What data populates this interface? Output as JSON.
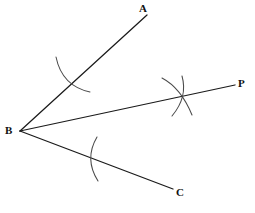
{
  "figure": {
    "background_color": "#ffffff",
    "line_color": "#1a1a1a",
    "arc_color": "#4a4a4a",
    "label_color": "#111111"
  },
  "labels": {
    "a": "A",
    "b": "B",
    "c": "C",
    "p": "P"
  },
  "chart_data": {
    "type": "diagram",
    "vertex": {
      "name": "B",
      "x": 20,
      "y": 131
    },
    "rays": [
      {
        "name": "BA",
        "from": [
          20,
          131
        ],
        "to": [
          147,
          15
        ],
        "endpoint_label": "A"
      },
      {
        "name": "BP",
        "from": [
          20,
          131
        ],
        "to": [
          235,
          85
        ],
        "endpoint_label": "P"
      },
      {
        "name": "BC",
        "from": [
          20,
          131
        ],
        "to": [
          173,
          189
        ],
        "endpoint_label": "C"
      }
    ],
    "arcs": [
      {
        "name": "arc-on-BA",
        "start": [
          56,
          57
        ],
        "end": [
          90,
          92
        ],
        "crosses_ray": "BA",
        "crossing_point": [
          72,
          77
        ]
      },
      {
        "name": "arc-on-BC",
        "start": [
          97,
          137
        ],
        "end": [
          98,
          181
        ],
        "crosses_ray": "BC",
        "crossing_point": [
          94,
          158
        ]
      },
      {
        "name": "arc-intersection-1",
        "start": [
          162,
          78
        ],
        "end": [
          192,
          115
        ],
        "crosses_ray": "BP",
        "crossing_point": [
          182,
          93
        ]
      },
      {
        "name": "arc-intersection-2",
        "start": [
          182,
          76
        ],
        "end": [
          172,
          116
        ],
        "crosses_ray": "BP",
        "crossing_point": [
          182,
          93
        ]
      }
    ],
    "label_positions": [
      {
        "text": "A",
        "x": 139,
        "y": 3
      },
      {
        "text": "B",
        "x": 5,
        "y": 125
      },
      {
        "text": "C",
        "x": 176,
        "y": 187
      },
      {
        "text": "P",
        "x": 238,
        "y": 78
      }
    ],
    "grid": false,
    "legend": false
  }
}
